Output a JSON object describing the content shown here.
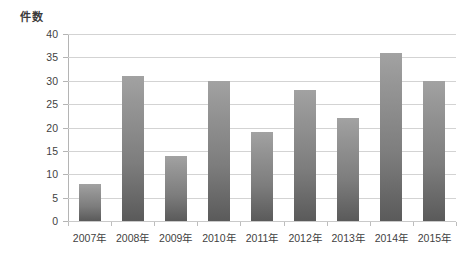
{
  "chart_data": {
    "type": "bar",
    "title": "",
    "subtitle": "",
    "xlabel": "",
    "ylabel": "件数",
    "categories": [
      "2007年",
      "2008年",
      "2009年",
      "2010年",
      "2011年",
      "2012年",
      "2013年",
      "2014年",
      "2015年"
    ],
    "values": [
      8,
      31,
      14,
      30,
      19,
      28,
      22,
      36,
      30
    ],
    "series": [
      {
        "name": "件数",
        "values": [
          8,
          31,
          14,
          30,
          19,
          28,
          22,
          36,
          30
        ]
      }
    ],
    "ylim": [
      0,
      40
    ],
    "ytick_step": 5,
    "yticks": [
      0,
      5,
      10,
      15,
      20,
      25,
      30,
      35,
      40
    ],
    "ytick_labels": [
      "0",
      "5",
      "10",
      "15",
      "20",
      "25",
      "30",
      "35",
      "40"
    ],
    "grid": {
      "horizontal": true,
      "vertical": false
    },
    "legend": {
      "visible": false,
      "position": "none"
    },
    "annotations": [],
    "colors": {
      "bar_top": "#a2a2a2",
      "bar_bottom": "#5a5a5a",
      "gridline": "#d3d3d3",
      "axis_line": "#b4b4b4",
      "text": "#3f3f3f",
      "background": "#ffffff"
    }
  }
}
